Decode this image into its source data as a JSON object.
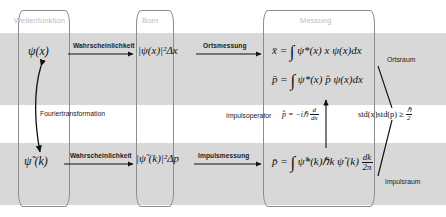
{
  "diagram": {
    "title_columns": [
      {
        "id": "wellenfunktion",
        "label": "Wellenfunktion"
      },
      {
        "id": "born",
        "label": "Born"
      },
      {
        "id": "messung",
        "label": "Messung"
      }
    ],
    "band_color": "#d8d8d8",
    "box_border_color": "#8c8c8c",
    "header_text_color": "#bdbdbd"
  },
  "position_space": {
    "wavefunction": "ψ(x)",
    "born_rule": "|ψ(x)|²Δx",
    "expectation_x_lhs": "x̄ =",
    "expectation_x_rhs": "ψ*(x) x ψ(x)dx",
    "expectation_p_lhs": "p̄ =",
    "expectation_p_rhs": "ψ*(x) p̂ ψ(x)dx",
    "space_label": "Ortsraum"
  },
  "momentum_space": {
    "wavefunction": "ψ̃ (k)",
    "born_rule": "|ψ̃ (k)|²Δp",
    "expectation_p_lhs": "p̄ =",
    "expectation_p_rhs": "ψ̃*(k)ℏk ψ̃ (k)",
    "expectation_p_measure_num": "dk",
    "expectation_p_measure_den": "2π",
    "space_label": "Impulsraum"
  },
  "arrows": {
    "probability_top": "Wahrscheinlichkeit",
    "probability_bottom": "Wahrscheinlichkeit",
    "position_measurement": "Ortsmessung",
    "momentum_measurement": "Impulsmessung",
    "fourier": "Fouriertransformation"
  },
  "operator": {
    "name": "Impulsoperator",
    "symbol_lhs": "p̂ = −iℏ",
    "derivative_num": "d",
    "derivative_den": "dx"
  },
  "uncertainty": {
    "expression": "std(x)std(p) ≥",
    "bound_num": "ℏ",
    "bound_den": "2"
  }
}
